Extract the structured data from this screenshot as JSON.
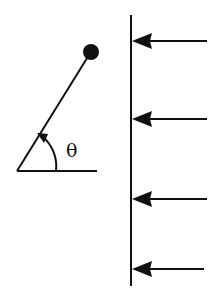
{
  "diagram": {
    "type": "physics-sketch",
    "colors": {
      "ink": "#111111",
      "background": "#ffffff"
    },
    "pendulum": {
      "pivot": {
        "x": 17,
        "y": 171
      },
      "bob": {
        "x": 91,
        "y": 52,
        "r": 8
      },
      "baseline_end_x": 97,
      "angle_label": "θ",
      "angle_label_pos": {
        "x": 66,
        "y": 157
      }
    },
    "wall": {
      "x": 131,
      "y_top": 15,
      "y_bottom": 286
    },
    "arrows": [
      {
        "y": 41,
        "x_tail": 207,
        "x_head": 132
      },
      {
        "y": 119,
        "x_tail": 207,
        "x_head": 132
      },
      {
        "y": 199,
        "x_tail": 207,
        "x_head": 132
      },
      {
        "y": 269,
        "x_tail": 204,
        "x_head": 132
      }
    ]
  }
}
